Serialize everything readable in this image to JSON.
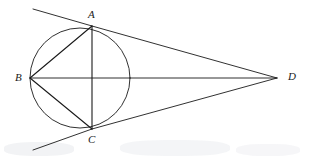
{
  "figure": {
    "background_color": "#ffffff",
    "stroke_color": "#1a1a1a",
    "label_color": "#1a1a1a",
    "width": 310,
    "height": 159
  },
  "labels": {
    "a": "A",
    "b": "B",
    "c": "C",
    "d": "D"
  },
  "chart_data": {
    "type": "diagram",
    "circle": {
      "cx": 80,
      "cy": 78,
      "r": 50
    },
    "points": [
      {
        "name": "A",
        "x": 92,
        "y": 26,
        "on_circle": true,
        "label_x": 88,
        "label_y": 9
      },
      {
        "name": "B",
        "x": 30,
        "y": 78,
        "on_circle": true,
        "label_x": 15,
        "label_y": 72
      },
      {
        "name": "C",
        "x": 92,
        "y": 129,
        "on_circle": true,
        "label_x": 88,
        "label_y": 134
      },
      {
        "name": "D",
        "x": 277,
        "y": 78,
        "on_circle": false,
        "label_x": 288,
        "label_y": 71
      }
    ],
    "segments": [
      {
        "name": "AB",
        "from": "A",
        "to": "B"
      },
      {
        "name": "BC",
        "from": "B",
        "to": "C"
      },
      {
        "name": "AC",
        "from": "A",
        "to": "C"
      },
      {
        "name": "BD",
        "from": "B",
        "to": "D"
      },
      {
        "name": "AD",
        "from": "A",
        "to": "D",
        "tangent": true
      },
      {
        "name": "CD",
        "from": "C",
        "to": "D",
        "tangent": true
      }
    ],
    "tangent_extensions": [
      {
        "name": "tangent-at-A-extension",
        "from": [
          92,
          26
        ],
        "to": [
          33,
          9
        ]
      },
      {
        "name": "tangent-at-C-extension",
        "from": [
          92,
          129
        ],
        "to": [
          33,
          150
        ]
      }
    ]
  }
}
